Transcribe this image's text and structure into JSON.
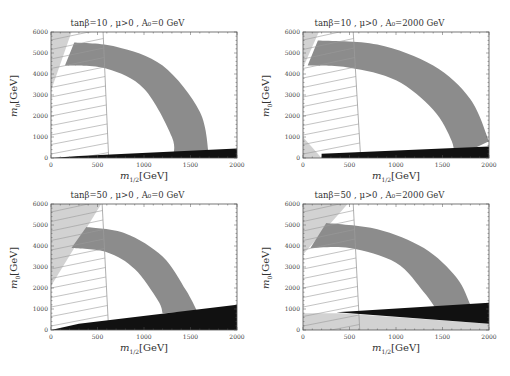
{
  "chart_data": [
    {
      "type": "area",
      "title": "tanβ=10, μ>0, A₀=0 GeV",
      "xlabel": "m1/2 [GeV]",
      "ylabel": "m0 [GeV]",
      "xlim": [
        0,
        2000
      ],
      "ylim": [
        0,
        6000
      ],
      "xticks": [
        "0",
        "500",
        "1000",
        "1500",
        "2000"
      ],
      "yticks": [
        "0",
        "1000",
        "2000",
        "3000",
        "4000",
        "5000",
        "6000"
      ],
      "regions": {
        "band_dark_gray": {
          "inner_edge": [
            [
              150,
              4400
            ],
            [
              600,
              4250
            ],
            [
              1000,
              3300
            ],
            [
              1300,
              1000
            ],
            [
              1310,
              0
            ]
          ],
          "outer_edge": [
            [
              250,
              5500
            ],
            [
              700,
              5300
            ],
            [
              1200,
              4400
            ],
            [
              1600,
              2200
            ],
            [
              1700,
              0
            ]
          ]
        },
        "hatched_excluded": {
          "right_edge_top": [
            560,
            6000
          ],
          "right_edge_bottom": [
            620,
            0
          ]
        },
        "light_gray_top_left": {
          "vertices": [
            [
              0,
              6000
            ],
            [
              220,
              6000
            ],
            [
              0,
              3200
            ]
          ]
        },
        "black_stau_region": {
          "vertices": [
            [
              0,
              0
            ],
            [
              2000,
              0
            ],
            [
              2000,
              450
            ],
            [
              300,
              100
            ]
          ]
        }
      }
    },
    {
      "type": "area",
      "title": "tanβ=10, μ>0, A₀=2000 GeV",
      "xlabel": "m1/2 [GeV]",
      "ylabel": "m0 [GeV]",
      "xlim": [
        0,
        2000
      ],
      "ylim": [
        0,
        6000
      ],
      "xticks": [
        "0",
        "500",
        "1000",
        "1500",
        "2000"
      ],
      "yticks": [
        "0",
        "1000",
        "2000",
        "3000",
        "4000",
        "5000",
        "6000"
      ],
      "regions": {
        "band_dark_gray": {
          "inner_edge": [
            [
              50,
              4400
            ],
            [
              500,
              4300
            ],
            [
              1000,
              3700
            ],
            [
              1400,
              2300
            ],
            [
              1600,
              800
            ],
            [
              1620,
              0
            ]
          ],
          "outer_edge": [
            [
              160,
              5600
            ],
            [
              800,
              5400
            ],
            [
              1400,
              4400
            ],
            [
              1800,
              2800
            ],
            [
              2000,
              800
            ]
          ]
        },
        "hatched_excluded": {
          "right_edge_top": [
            540,
            6000
          ],
          "right_edge_bottom": [
            620,
            0
          ]
        },
        "light_gray_top_left": {
          "vertices": [
            [
              0,
              6000
            ],
            [
              170,
              6000
            ],
            [
              0,
              4300
            ]
          ]
        },
        "light_gray_bottom_left": {
          "vertices": [
            [
              0,
              0
            ],
            [
              200,
              0
            ],
            [
              0,
              1000
            ]
          ]
        },
        "black_stau_region": {
          "vertices": [
            [
              200,
              0
            ],
            [
              2000,
              0
            ],
            [
              2000,
              550
            ],
            [
              200,
              200
            ]
          ]
        }
      }
    },
    {
      "type": "area",
      "title": "tanβ=50, μ>0, A₀=0 GeV",
      "xlabel": "m1/2 [GeV]",
      "ylabel": "m0 [GeV]",
      "xlim": [
        0,
        2000
      ],
      "ylim": [
        0,
        6000
      ],
      "xticks": [
        "0",
        "500",
        "1000",
        "1500",
        "2000"
      ],
      "yticks": [
        "0",
        "1000",
        "2000",
        "3000",
        "4000",
        "5000",
        "6000"
      ],
      "regions": {
        "band_dark_gray": {
          "inner_edge": [
            [
              220,
              3900
            ],
            [
              600,
              3700
            ],
            [
              900,
              2900
            ],
            [
              1150,
              1400
            ],
            [
              1200,
              800
            ]
          ],
          "outer_edge": [
            [
              380,
              4900
            ],
            [
              800,
              4600
            ],
            [
              1200,
              3500
            ],
            [
              1450,
              1900
            ],
            [
              1570,
              900
            ]
          ]
        },
        "hatched_excluded": {
          "right_edge_top": [
            550,
            6000
          ],
          "right_edge_bottom": [
            620,
            0
          ]
        },
        "light_gray_top_left": {
          "vertices": [
            [
              0,
              6000
            ],
            [
              540,
              6000
            ],
            [
              0,
              2100
            ]
          ]
        },
        "black_stau_region": {
          "vertices": [
            [
              0,
              0
            ],
            [
              2000,
              0
            ],
            [
              2000,
              1200
            ],
            [
              300,
              300
            ]
          ]
        }
      }
    },
    {
      "type": "area",
      "title": "tanβ=50, μ>0, A₀=2000 GeV",
      "xlabel": "m1/2 [GeV]",
      "ylabel": "m0 [GeV]",
      "xlim": [
        0,
        2000
      ],
      "ylim": [
        0,
        6000
      ],
      "xticks": [
        "0",
        "500",
        "1000",
        "1500",
        "2000"
      ],
      "yticks": [
        "0",
        "1000",
        "2000",
        "3000",
        "4000",
        "5000",
        "6000"
      ],
      "regions": {
        "band_dark_gray": {
          "inner_edge": [
            [
              80,
              3900
            ],
            [
              500,
              3900
            ],
            [
              1000,
              3200
            ],
            [
              1300,
              1800
            ],
            [
              1430,
              1000
            ]
          ],
          "outer_edge": [
            [
              250,
              5100
            ],
            [
              800,
              4800
            ],
            [
              1300,
              3900
            ],
            [
              1650,
              2500
            ],
            [
              1800,
              1200
            ]
          ]
        },
        "hatched_excluded": {
          "right_edge_top": [
            540,
            6000
          ],
          "right_edge_bottom": [
            610,
            0
          ]
        },
        "light_gray_top_left": {
          "vertices": [
            [
              0,
              6000
            ],
            [
              480,
              6000
            ],
            [
              0,
              3600
            ]
          ]
        },
        "light_gray_bottom": {
          "vertices": [
            [
              0,
              0
            ],
            [
              2000,
              0
            ],
            [
              2000,
              300
            ],
            [
              400,
              800
            ],
            [
              0,
              800
            ]
          ]
        },
        "black_stau_region": {
          "vertices": [
            [
              360,
              850
            ],
            [
              2000,
              1300
            ],
            [
              2000,
              300
            ]
          ]
        }
      }
    }
  ],
  "panels": [
    {
      "title": "tanβ=10 ,  μ>0 ,  A₀=0  GeV",
      "xlabel": "m",
      "xlabel_sub": "1/2",
      "xlabel_unit": "[GeV]",
      "ylabel": "m",
      "ylabel_sub": "0",
      "ylabel_unit": "[GeV]"
    },
    {
      "title": "tanβ=10 ,  μ>0 ,  A₀=2000  GeV",
      "xlabel": "m",
      "xlabel_sub": "1/2",
      "xlabel_unit": "[GeV]",
      "ylabel": "m",
      "ylabel_sub": "0",
      "ylabel_unit": "[GeV]"
    },
    {
      "title": "tanβ=50 ,  μ>0 ,  A₀=0  GeV",
      "xlabel": "m",
      "xlabel_sub": "1/2",
      "xlabel_unit": "[GeV]",
      "ylabel": "m",
      "ylabel_sub": "0",
      "ylabel_unit": "[GeV]"
    },
    {
      "title": "tanβ=50 ,  μ>0 ,  A₀=2000  GeV",
      "xlabel": "m",
      "xlabel_sub": "1/2",
      "xlabel_unit": "[GeV]",
      "ylabel": "m",
      "ylabel_sub": "0",
      "ylabel_unit": "[GeV]"
    }
  ],
  "axis": {
    "xticks": [
      "0",
      "500",
      "1000",
      "1500",
      "2000"
    ],
    "yticks": [
      "0",
      "1000",
      "2000",
      "3000",
      "4000",
      "5000",
      "6000"
    ]
  },
  "colors": {
    "band": "#8c8c8c",
    "light_gray": "#d2d2d2",
    "black": "#111111",
    "hatch": "#9a9a9a",
    "frame": "#555555"
  }
}
